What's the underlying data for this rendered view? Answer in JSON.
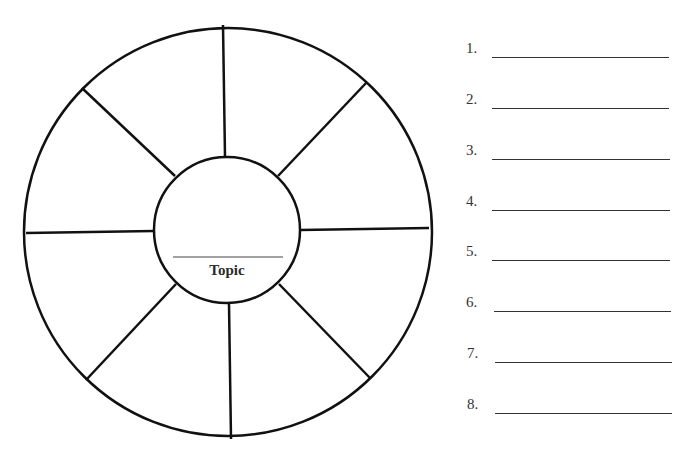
{
  "wheel": {
    "center_label": "Topic",
    "spokes": 8,
    "outer_circle": {
      "cx": 228,
      "cy": 232,
      "r": 204
    },
    "inner_circle": {
      "cx": 227,
      "cy": 230,
      "r": 73
    },
    "stroke_color": "#111111"
  },
  "list": {
    "items": [
      {
        "label": "1.",
        "value": ""
      },
      {
        "label": "2.",
        "value": ""
      },
      {
        "label": "3.",
        "value": ""
      },
      {
        "label": "4.",
        "value": ""
      },
      {
        "label": "5.",
        "value": ""
      },
      {
        "label": "6.",
        "value": ""
      },
      {
        "label": "7.",
        "value": ""
      },
      {
        "label": "8.",
        "value": ""
      }
    ]
  }
}
